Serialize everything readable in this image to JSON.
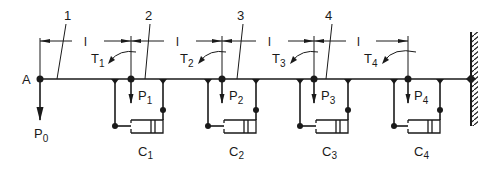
{
  "figure": {
    "type": "mechanical schematic"
  },
  "labels": {
    "end_point": "A",
    "load_at_A": "P",
    "load_at_A_sub": "0",
    "segment_length": "l",
    "callouts": [
      "1",
      "2",
      "3",
      "4"
    ]
  },
  "nodes": [
    {
      "index": 1,
      "torque": "T",
      "torque_sub": "1",
      "load": "P",
      "load_sub": "1",
      "cylinder": "C",
      "cylinder_sub": "1"
    },
    {
      "index": 2,
      "torque": "T",
      "torque_sub": "2",
      "load": "P",
      "load_sub": "2",
      "cylinder": "C",
      "cylinder_sub": "2"
    },
    {
      "index": 3,
      "torque": "T",
      "torque_sub": "3",
      "load": "P",
      "load_sub": "3",
      "cylinder": "C",
      "cylinder_sub": "3"
    },
    {
      "index": 4,
      "torque": "T",
      "torque_sub": "4",
      "load": "P",
      "load_sub": "4",
      "cylinder": "C",
      "cylinder_sub": "4"
    }
  ],
  "colors": {
    "ink": "#1a1a1a",
    "background": "#ffffff"
  }
}
